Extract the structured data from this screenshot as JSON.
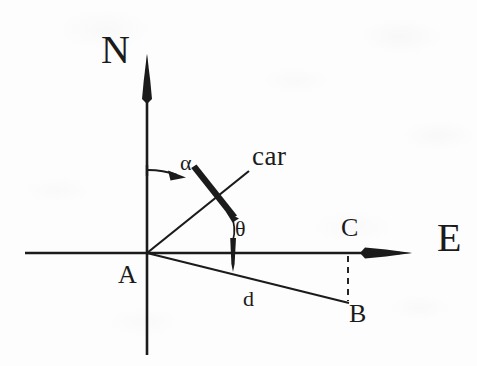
{
  "figure": {
    "background_color": "#fdfdfd",
    "ink_color": "#1b1b1b",
    "width": 477,
    "height": 366
  },
  "axes": {
    "north": {
      "label": "N",
      "name": "north-axis",
      "direction": "up",
      "x": 147,
      "top_y": 55,
      "bottom_y": 355
    },
    "east": {
      "label": "E",
      "name": "east-axis",
      "direction": "right",
      "y": 253,
      "left_x": 25,
      "right_x": 410
    }
  },
  "points": {
    "origin": {
      "label": "A",
      "x": 147,
      "y": 253
    },
    "foot": {
      "label": "C",
      "x": 348,
      "y": 253
    },
    "target": {
      "label": "B",
      "x": 348,
      "y": 303
    }
  },
  "annotations": {
    "car": {
      "label": "car",
      "name": "car-label"
    },
    "alpha": {
      "label": "α",
      "name": "alpha-angle-label"
    },
    "theta": {
      "label": "θ",
      "name": "theta-angle-label"
    },
    "distance": {
      "label": "d",
      "name": "distance-label"
    }
  },
  "segments": {
    "bearing_line": {
      "name": "bearing-line",
      "from": "A",
      "to": "car"
    },
    "distance_line": {
      "name": "distance-line-d",
      "from": "A",
      "to": "B"
    },
    "projection_line": {
      "name": "dashed-projection-line",
      "from": "C",
      "to": "B",
      "style": "dashed"
    }
  }
}
